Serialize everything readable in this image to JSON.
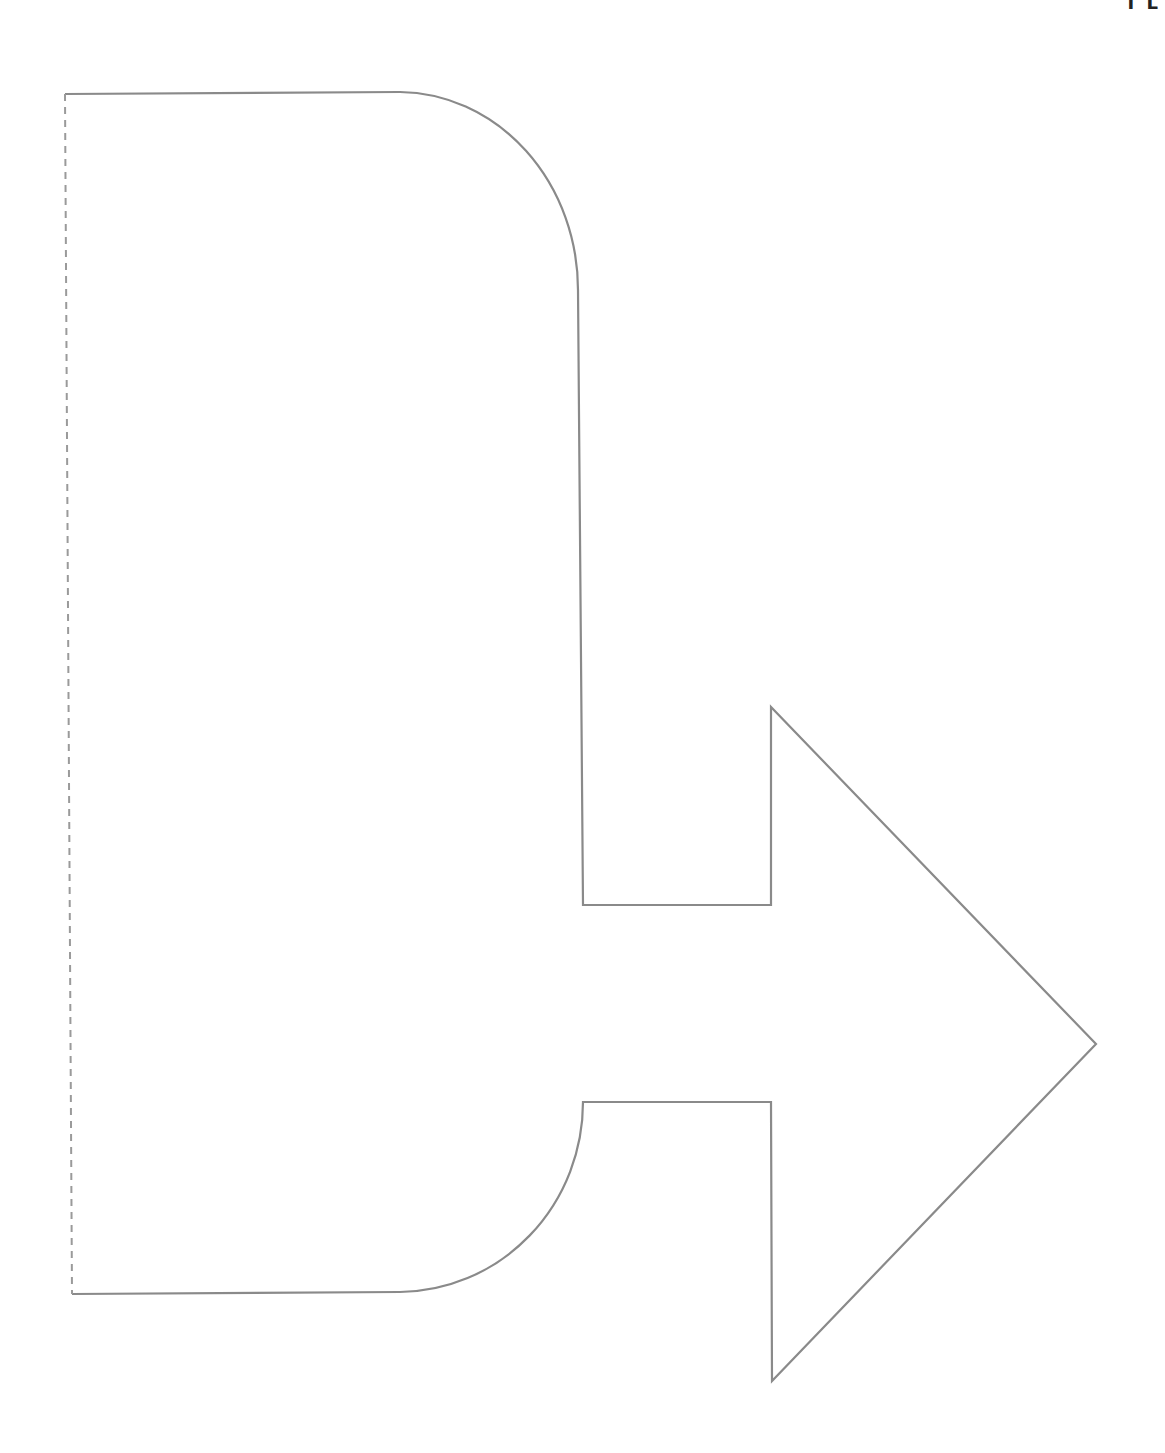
{
  "page": {
    "corner_label": "I L"
  },
  "diagram": {
    "type": "template-outline",
    "colors": {
      "outline": "#8a8a8a",
      "fold_line": "#9a9a9a",
      "background": "#ffffff"
    },
    "shape": {
      "outline_path": "M 72 1294 L 400 1292 A 185 190 0 0 0 583 1102 L 771 1102 L 772 1381 L 1096 1044 L 771 707 L 771 905 L 583 905 L 578 290 A 180 198 0 0 0 400 92 L 65 94",
      "fold_line": {
        "x1": 65,
        "y1": 94,
        "x2": 72,
        "y2": 1294,
        "style": "dashed"
      }
    }
  }
}
